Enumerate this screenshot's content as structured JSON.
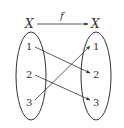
{
  "diagram": {
    "function_label": "f",
    "domain_label": "X",
    "codomain_label": "X",
    "domain_elements": [
      "1",
      "2",
      "3"
    ],
    "codomain_elements": [
      "1",
      "2",
      "3"
    ],
    "mappings": [
      {
        "from": "1",
        "to": "2"
      },
      {
        "from": "2",
        "to": "3"
      },
      {
        "from": "3",
        "to": "1"
      }
    ],
    "stroke_color": "#333333"
  }
}
